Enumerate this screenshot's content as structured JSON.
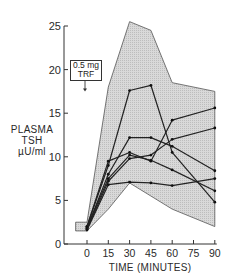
{
  "chart_data": {
    "type": "line",
    "title": "",
    "xlabel": "TIME (MINUTES)",
    "ylabel": "PLASMA TSH µU/ml",
    "ylabel_lines": [
      "PLASMA",
      "TSH",
      "µU/ml"
    ],
    "xlim": [
      -10,
      90
    ],
    "ylim": [
      0,
      25
    ],
    "x_ticks": [
      0,
      15,
      30,
      45,
      60,
      75,
      90
    ],
    "y_ticks": [
      0,
      5,
      10,
      15,
      20,
      25
    ],
    "grid": false,
    "legend": null,
    "annotation": {
      "lines": [
        "0.5 mg",
        "TRF"
      ],
      "x": 0,
      "arrow_to_y": 17.5
    },
    "x": [
      0,
      15,
      30,
      45,
      60,
      90
    ],
    "series": [
      {
        "name": "Subject 1",
        "values": [
          2.0,
          9.0,
          17.6,
          18.2,
          10.5,
          4.8
        ]
      },
      {
        "name": "Subject 2",
        "values": [
          1.8,
          8.0,
          12.2,
          12.2,
          11.2,
          8.4
        ]
      },
      {
        "name": "Subject 3",
        "values": [
          2.0,
          9.5,
          10.5,
          9.5,
          14.2,
          15.6
        ]
      },
      {
        "name": "Subject 4",
        "values": [
          1.7,
          7.2,
          9.8,
          10.2,
          12.0,
          13.3
        ]
      },
      {
        "name": "Subject 5",
        "values": [
          1.9,
          7.5,
          10.2,
          9.6,
          8.5,
          6.1
        ]
      },
      {
        "name": "Subject 6",
        "values": [
          1.6,
          6.8,
          7.1,
          7.0,
          6.7,
          7.5
        ]
      }
    ],
    "range_envelope": {
      "description": "Shaded range of responses",
      "x": [
        -8,
        0,
        15,
        30,
        45,
        60,
        90
      ],
      "upper": [
        2.5,
        2.5,
        18.0,
        25.5,
        24.5,
        18.5,
        17.5
      ],
      "lower": [
        1.5,
        1.5,
        4.0,
        7.0,
        5.5,
        4.0,
        2.0
      ]
    }
  }
}
